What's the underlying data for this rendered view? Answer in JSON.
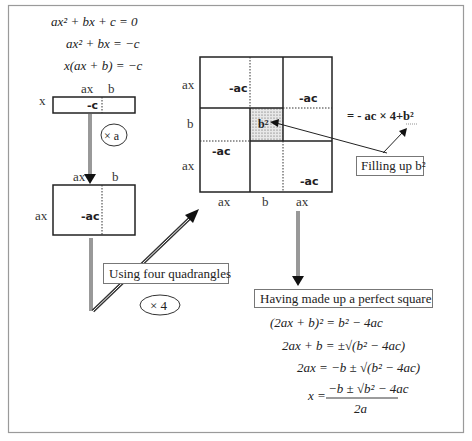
{
  "equations_top": [
    "ax² + bx + c = 0",
    "ax² + bx = −c",
    "x(ax + b) = −c"
  ],
  "rect1": {
    "top_labels": [
      "ax",
      "b"
    ],
    "left_label": "x",
    "cell_label": "-c",
    "multiplier": "× a"
  },
  "rect2": {
    "top_labels": [
      "ax",
      "b"
    ],
    "left_label": "ax",
    "cell_label": "-ac"
  },
  "big_square": {
    "left_labels": [
      "ax",
      "b",
      "ax"
    ],
    "bottom_labels": [
      "ax",
      "b",
      "ax"
    ],
    "cells": [
      "-ac",
      "-ac",
      "-ac",
      "-ac"
    ],
    "center_label": "b²"
  },
  "callouts": {
    "using_four": "Using four quadrangles",
    "times_four": "× 4",
    "filling_up": "Filling up b²",
    "sum_expression": "= - ac × 4+b²",
    "perfect_square": "Having made up a perfect square"
  },
  "equations_bottom": [
    "(2ax + b)² = b² − 4ac",
    "2ax + b = ±√(b² − 4ac)",
    "2ax = −b ± √(b² − 4ac)",
    "x = (−b ± √(b² − 4ac)) / 2a"
  ],
  "final": {
    "numerator": "−b ± √b² − 4ac",
    "denominator": "2a",
    "lhs": "x ="
  }
}
